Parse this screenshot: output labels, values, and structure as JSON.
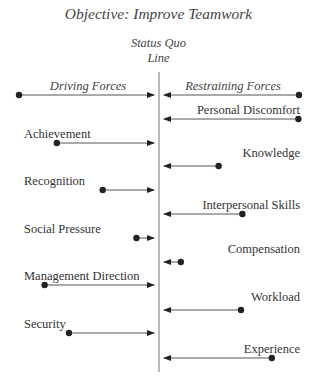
{
  "diagram": {
    "type": "force-field-analysis",
    "objective": "Objective: Improve Teamwork",
    "status_quo_line": [
      "Status Quo",
      "Line"
    ],
    "headers": {
      "driving": "Driving Forces",
      "restraining": "Restraining Forces"
    },
    "colors": {
      "line": "#555555",
      "dot": "#222222",
      "text": "#333333"
    },
    "driving_forces": [
      {
        "label": "Achievement",
        "strength": 0.72
      },
      {
        "label": "Recognition",
        "strength": 0.38
      },
      {
        "label": "Social Pressure",
        "strength": 0.13
      },
      {
        "label": "Management Direction",
        "strength": 0.81
      },
      {
        "label": "Security",
        "strength": 0.63
      }
    ],
    "restraining_forces": [
      {
        "label": "Personal Discomfort",
        "strength": 0.96
      },
      {
        "label": "Knowledge",
        "strength": 0.39
      },
      {
        "label": "Interpersonal Skills",
        "strength": 0.56
      },
      {
        "label": "Compensation",
        "strength": 0.12
      },
      {
        "label": "Workload",
        "strength": 0.55
      },
      {
        "label": "Experience",
        "strength": 0.77
      }
    ]
  }
}
